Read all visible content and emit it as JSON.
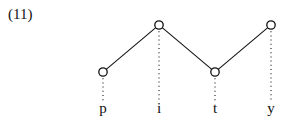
{
  "example_number": "(11)",
  "diagram": {
    "type": "autosegmental-tone-diagram",
    "segments": [
      "p",
      "i",
      "t",
      "y"
    ],
    "tone_nodes": [
      {
        "segment": "p",
        "level": "low"
      },
      {
        "segment": "i",
        "level": "high"
      },
      {
        "segment": "t",
        "level": "low"
      },
      {
        "segment": "y",
        "level": "high"
      }
    ],
    "connections": [
      [
        "p",
        "i"
      ],
      [
        "i",
        "t"
      ],
      [
        "t",
        "y"
      ]
    ],
    "association_style": "dotted",
    "colors": {
      "ink": "#111111",
      "background": "#ffffff"
    }
  }
}
